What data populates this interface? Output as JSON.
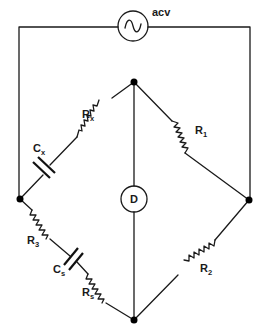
{
  "diagram": {
    "source": {
      "label": "acv",
      "icon": "ac-source-icon"
    },
    "detector": {
      "label": "D",
      "icon": "detector-icon"
    },
    "components": [
      {
        "id": "Rx",
        "type": "resistor",
        "label": "R",
        "sub": "x",
        "arm": "left-upper"
      },
      {
        "id": "Cx",
        "type": "capacitor",
        "label": "C",
        "sub": "x",
        "arm": "left-upper"
      },
      {
        "id": "R1",
        "type": "resistor",
        "label": "R",
        "sub": "1",
        "arm": "right-upper"
      },
      {
        "id": "R3",
        "type": "resistor",
        "label": "R",
        "sub": "3",
        "arm": "left-lower"
      },
      {
        "id": "Cs",
        "type": "capacitor",
        "label": "C",
        "sub": "s",
        "arm": "left-lower"
      },
      {
        "id": "Rs",
        "type": "resistor",
        "label": "R",
        "sub": "s",
        "arm": "left-lower"
      },
      {
        "id": "R2",
        "type": "resistor",
        "label": "R",
        "sub": "2",
        "arm": "right-lower"
      }
    ],
    "nodes": [
      "top",
      "left",
      "right",
      "bottom"
    ],
    "colors": {
      "ink": "#1a1a1a",
      "background": "#ffffff"
    }
  }
}
